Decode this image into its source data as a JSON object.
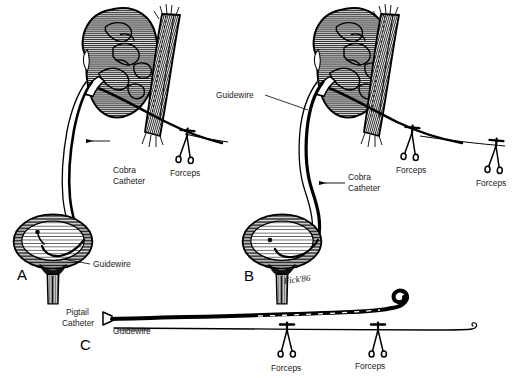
{
  "figure": {
    "background_color": "#ffffff",
    "ink_color": "#000000",
    "label_color": "#1a1a1a",
    "type": "medical line-art illustration"
  },
  "panels": [
    {
      "id": "A",
      "letter": "A",
      "labels": [
        {
          "name": "cobra-catheter",
          "text_line1": "Cobra",
          "text_line2": "Catheter"
        },
        {
          "name": "forceps",
          "text": "Forceps"
        },
        {
          "name": "guidewire",
          "text": "Guidewire"
        }
      ],
      "anatomy": [
        "kidney",
        "percutaneous-tract",
        "ureter",
        "bladder",
        "urethra"
      ],
      "instruments": [
        "cobra-catheter",
        "guidewire",
        "forceps"
      ]
    },
    {
      "id": "B",
      "letter": "B",
      "labels": [
        {
          "name": "guidewire",
          "text": "Guidewire"
        },
        {
          "name": "cobra-catheter",
          "text_line1": "Cobra",
          "text_line2": "Catheter"
        },
        {
          "name": "forceps-left",
          "text": "Forceps"
        },
        {
          "name": "forceps-right",
          "text": "Forceps"
        }
      ],
      "anatomy": [
        "kidney",
        "percutaneous-tract",
        "ureter",
        "bladder",
        "urethra"
      ],
      "instruments": [
        "cobra-catheter",
        "guidewire",
        "forceps",
        "forceps"
      ],
      "signature": "Fick '86"
    },
    {
      "id": "C",
      "letter": "C",
      "labels": [
        {
          "name": "pigtail-catheter",
          "text_line1": "Pigtail",
          "text_line2": "Catheter"
        },
        {
          "name": "guidewire",
          "text": "Guidewire"
        },
        {
          "name": "forceps-left",
          "text": "Forceps"
        },
        {
          "name": "forceps-right",
          "text": "Forceps"
        }
      ],
      "instruments": [
        "pigtail-catheter",
        "guidewire",
        "forceps",
        "forceps"
      ]
    }
  ],
  "text": {
    "cobra_catheter_line1": "Cobra",
    "cobra_catheter_line2": "Catheter",
    "pigtail_catheter_line1": "Pigtail",
    "pigtail_catheter_line2": "Catheter",
    "guidewire": "Guidewire",
    "forceps": "Forceps",
    "panel_a": "A",
    "panel_b": "B",
    "panel_c": "C",
    "signature": "Fick'86"
  }
}
